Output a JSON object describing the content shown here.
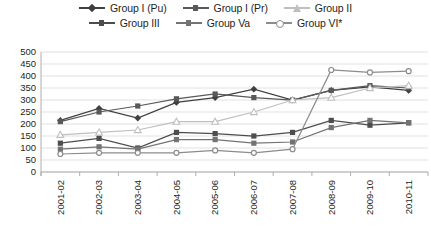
{
  "chart_data": {
    "type": "line",
    "title": "",
    "subtitle": "",
    "xlabel": "",
    "ylabel": "",
    "ylim": [
      0,
      500
    ],
    "ytick_step": 50,
    "yticks": [
      500,
      450,
      400,
      350,
      300,
      250,
      200,
      150,
      100,
      50,
      0
    ],
    "grid": true,
    "legend_position": "top",
    "categories": [
      "2001-02",
      "2002-03",
      "2003-04",
      "2004-05",
      "2005-06",
      "2006-07",
      "2007-08",
      "2008-09",
      "2009-10",
      "2010-11"
    ],
    "series": [
      {
        "name": "Group I (Pu)",
        "color": "#404040",
        "marker": "diamond",
        "values": [
          215,
          265,
          225,
          290,
          310,
          345,
          300,
          340,
          355,
          340
        ]
      },
      {
        "name": "Group I (Pr)",
        "color": "#595959",
        "marker": "square",
        "values": [
          210,
          250,
          275,
          305,
          325,
          310,
          300,
          340,
          360,
          350
        ]
      },
      {
        "name": "Group II",
        "color": "#bfbfbf",
        "marker": "triangle",
        "values": [
          155,
          165,
          175,
          210,
          210,
          250,
          300,
          310,
          350,
          360
        ]
      },
      {
        "name": "Group III",
        "color": "#4d4d4d",
        "marker": "square",
        "values": [
          120,
          140,
          100,
          165,
          160,
          150,
          165,
          215,
          195,
          205
        ]
      },
      {
        "name": "Group Va",
        "color": "#737373",
        "marker": "square",
        "values": [
          95,
          105,
          95,
          135,
          135,
          120,
          125,
          185,
          215,
          205
        ]
      },
      {
        "name": "Group VI*",
        "color": "#8c8c8c",
        "marker": "circle",
        "values": [
          75,
          80,
          80,
          80,
          90,
          80,
          95,
          425,
          415,
          420
        ]
      }
    ]
  },
  "legend": {
    "rows": [
      [
        {
          "label": "Group I (Pu)",
          "series": 0
        },
        {
          "label": "Group I (Pr)",
          "series": 1
        },
        {
          "label": "Group II",
          "series": 2
        }
      ],
      [
        {
          "label": "Group III",
          "series": 3
        },
        {
          "label": "Group Va",
          "series": 4
        },
        {
          "label": "Group VI*",
          "series": 5
        }
      ]
    ]
  }
}
